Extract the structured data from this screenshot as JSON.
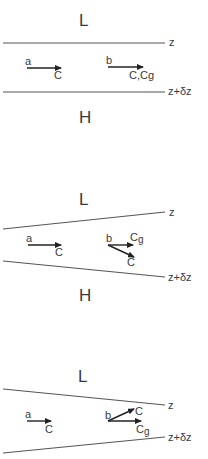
{
  "figure": {
    "panels": [
      {
        "id": "uniform",
        "top_region_label": "L",
        "bottom_region_label": "H",
        "upper_line_label": "z",
        "lower_line_label": "z+δz",
        "point_a": {
          "label": "a",
          "vector_label": "C"
        },
        "point_b": {
          "label": "b",
          "vector_label": "C,Cg"
        }
      },
      {
        "id": "converging-right",
        "top_region_label": "L",
        "bottom_region_label": "H",
        "upper_line_label": "z",
        "lower_line_label": "z+δz",
        "point_a": {
          "label": "a",
          "vector_label": "C"
        },
        "point_b": {
          "label": "b",
          "cg_label": "C",
          "cg_sub": "g",
          "c_label": "C"
        }
      },
      {
        "id": "diverging-right",
        "top_region_label": "L",
        "upper_line_label": "z",
        "lower_line_label": "z+δz",
        "point_a": {
          "label": "a",
          "vector_label": "C"
        },
        "point_b": {
          "label": "b",
          "c_label": "C",
          "cg_label": "C",
          "cg_sub": "g"
        }
      }
    ]
  },
  "colors": {
    "ink": "#222222",
    "line": "#555555",
    "text": "#3a3a3a",
    "background": "#ffffff"
  }
}
